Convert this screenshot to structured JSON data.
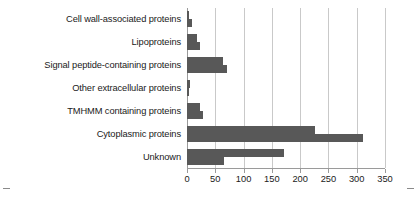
{
  "chart_data": {
    "type": "bar",
    "orientation": "horizontal",
    "title": "",
    "xlabel": "",
    "ylabel": "",
    "xlim": [
      0,
      350
    ],
    "grid": true,
    "legend": "none",
    "xticks": [
      0,
      50,
      100,
      150,
      200,
      250,
      300,
      350
    ],
    "xtick_labels": [
      "0",
      "50",
      "100",
      "150",
      "200",
      "250",
      "300",
      "350"
    ],
    "categories": [
      "Cell wall-associated proteins",
      "Lipoproteins",
      "Signal peptide-containing proteins",
      "Other extracellular proteins",
      "TMHMM containing proteins",
      "Cytoplasmic proteins",
      "Unknown"
    ],
    "series": [
      {
        "name": "series-1",
        "color": "#585858",
        "values": [
          3,
          18,
          63,
          6,
          23,
          227,
          172
        ]
      },
      {
        "name": "series-2",
        "color": "#585858",
        "values": [
          8,
          23,
          70,
          3,
          29,
          311,
          65
        ]
      }
    ]
  },
  "axis": {
    "bar_color": "#585858",
    "grid_color": "#c9c9c9",
    "axis_color": "#9a9a9a"
  }
}
